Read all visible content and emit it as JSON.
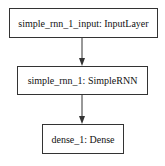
{
  "diagram": {
    "type": "model-graph",
    "nodes": [
      {
        "id": "simple_rnn_1_input",
        "label": "simple_rnn_1_input: InputLayer"
      },
      {
        "id": "simple_rnn_1",
        "label": "simple_rnn_1: SimpleRNN"
      },
      {
        "id": "dense_1",
        "label": "dense_1: Dense"
      }
    ],
    "edges": [
      {
        "from": "simple_rnn_1_input",
        "to": "simple_rnn_1"
      },
      {
        "from": "simple_rnn_1",
        "to": "dense_1"
      }
    ],
    "colors": {
      "stroke": "#333333",
      "background": "#ffffff",
      "text": "#111111"
    }
  }
}
